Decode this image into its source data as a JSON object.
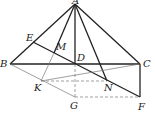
{
  "diagram": {
    "type": "geometry-figure",
    "points": {
      "A": {
        "label": "A",
        "x": 75,
        "y": 4,
        "lx": 72,
        "ly": 4
      },
      "B": {
        "label": "B",
        "x": 10,
        "y": 64,
        "lx": 0,
        "ly": 67
      },
      "C": {
        "label": "C",
        "x": 140,
        "y": 64,
        "lx": 143,
        "ly": 67
      },
      "D": {
        "label": "D",
        "x": 75,
        "y": 64,
        "lx": 77,
        "ly": 61
      },
      "E": {
        "label": "E",
        "x": 33,
        "y": 42,
        "lx": 26,
        "ly": 41
      },
      "M": {
        "label": "M",
        "x": 54,
        "y": 53,
        "lx": 56,
        "ly": 50
      },
      "K": {
        "label": "K",
        "x": 41,
        "y": 81,
        "lx": 34,
        "ly": 91
      },
      "N": {
        "label": "N",
        "x": 107,
        "y": 81,
        "lx": 104,
        "ly": 91
      },
      "G": {
        "label": "G",
        "x": 75,
        "y": 97,
        "lx": 70,
        "ly": 109
      },
      "F": {
        "label": "F",
        "x": 140,
        "y": 97,
        "lx": 138,
        "ly": 110
      }
    },
    "segments": [
      {
        "from": "A",
        "to": "B",
        "style": "solid"
      },
      {
        "from": "A",
        "to": "C",
        "style": "solid"
      },
      {
        "from": "A",
        "to": "D",
        "style": "solid"
      },
      {
        "from": "A",
        "to": "N",
        "style": "solid"
      },
      {
        "from": "A",
        "to": "M",
        "style": "solid"
      },
      {
        "from": "B",
        "to": "C",
        "style": "solid"
      },
      {
        "from": "E",
        "to": "F",
        "style": "solid"
      },
      {
        "from": "C",
        "to": "F",
        "style": "solid"
      },
      {
        "from": "M",
        "to": "K",
        "style": "thin"
      },
      {
        "from": "B",
        "to": "G",
        "style": "thin"
      },
      {
        "from": "C",
        "to": "K",
        "style": "thin"
      },
      {
        "from": "K",
        "to": "N",
        "style": "dashed"
      },
      {
        "from": "D",
        "to": "G",
        "style": "dashed"
      },
      {
        "from": "G",
        "to": "F",
        "style": "dashed"
      }
    ]
  }
}
